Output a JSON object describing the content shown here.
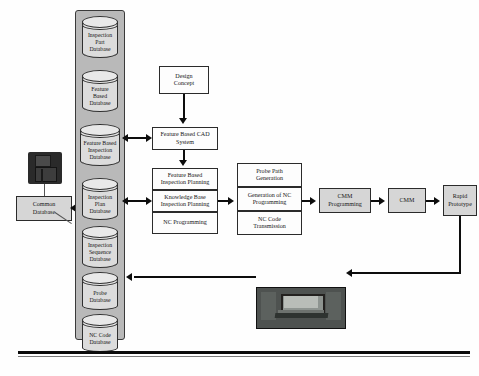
{
  "diagram": {
    "colors": {
      "box_fill": "#d6d6d6",
      "column_fill": "#b9b9b9",
      "database_fill": "#dcdcdc",
      "line": "#0d0d0d",
      "photo_frame": "#4e5250"
    },
    "common_storage": {
      "icon": "floppy-disk-icon",
      "box_label": "Common\nDatabase",
      "box_label_line1": "Common",
      "box_label_line2": "Database"
    },
    "database_column": {
      "name": "database-stack",
      "items": [
        {
          "id": "inspection-part-database",
          "lines": [
            "Inspection",
            "Part",
            "Database"
          ]
        },
        {
          "id": "feature-based-database",
          "lines": [
            "Feature",
            "Based",
            "Database"
          ]
        },
        {
          "id": "feature-based-inspection-database",
          "lines": [
            "Feature Based",
            "Inspection",
            "Database"
          ]
        },
        {
          "id": "inspection-plan-database",
          "lines": [
            "Inspection",
            "Plan",
            "Database"
          ]
        },
        {
          "id": "inspection-sequence-database",
          "lines": [
            "Inspection",
            "Sequence",
            "Database"
          ]
        },
        {
          "id": "probe-database",
          "lines": [
            "Probe",
            "Database"
          ]
        },
        {
          "id": "nc-code-database",
          "lines": [
            "NC Code",
            "Database"
          ]
        }
      ]
    },
    "process_nodes": {
      "design_concept": {
        "lines": [
          "Design",
          "Concept"
        ]
      },
      "feature_based_cad": {
        "lines": [
          "Feature Based CAD",
          "System"
        ]
      },
      "planning_group": [
        {
          "id": "feature-based-inspection-planning",
          "lines": [
            "Feature Based",
            "Inspection Planning"
          ]
        },
        {
          "id": "knowledge-base-inspection-planning",
          "lines": [
            "Knowledge Base",
            "Inspection Planning"
          ]
        },
        {
          "id": "nc-programming",
          "lines": [
            "NC Programming"
          ]
        }
      ],
      "probe_group": [
        {
          "id": "probe-path-generation",
          "lines": [
            "Probe Path",
            "Generation"
          ]
        },
        {
          "id": "generation-of-nc-programming",
          "lines": [
            "Generation of NC",
            "Programming"
          ]
        },
        {
          "id": "nc-code-transmission",
          "lines": [
            "NC Code",
            "Transmission"
          ]
        }
      ],
      "cmm_programming": {
        "lines": [
          "CMM",
          "Programming"
        ]
      },
      "cmm": {
        "lines": [
          "CMM"
        ]
      },
      "rapid_prototype": {
        "lines": [
          "Rapid",
          "Prototype"
        ]
      }
    },
    "computer": {
      "id": "computer-workstation-photo",
      "label": ""
    }
  }
}
